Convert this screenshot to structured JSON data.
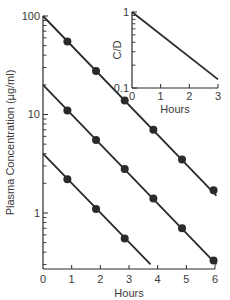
{
  "chart_data": [
    {
      "type": "line",
      "title": "",
      "xlabel": "Hours",
      "ylabel": "Plasma Concentration (µg/ml)",
      "yscale": "log",
      "xlim": [
        0,
        6
      ],
      "ylim": [
        0.27,
        100
      ],
      "x_ticks": [
        0,
        1,
        2,
        3,
        4,
        5,
        6
      ],
      "x_tick_labels": [
        "0",
        "1",
        "2",
        "3",
        "4",
        "5",
        "6"
      ],
      "y_tick_labels": [
        {
          "value": 100,
          "label": "100"
        },
        {
          "value": 10,
          "label": "10"
        },
        {
          "value": 1,
          "label": "1"
        }
      ],
      "grid": false,
      "series": [
        {
          "name": "dose-high",
          "line": {
            "x": [
              0,
              6.05
            ],
            "y": [
              100,
              1.5
            ]
          },
          "points": {
            "x": [
              0.85,
              1.85,
              2.85,
              3.85,
              4.85,
              5.95
            ],
            "y": [
              55,
              27.7,
              13.9,
              7.0,
              3.5,
              1.7
            ]
          }
        },
        {
          "name": "dose-mid",
          "line": {
            "x": [
              0,
              6.05
            ],
            "y": [
              20,
              0.3
            ]
          },
          "points": {
            "x": [
              0.85,
              1.85,
              2.85,
              3.85,
              4.85,
              5.95
            ],
            "y": [
              11,
              5.5,
              2.8,
              1.4,
              0.7,
              0.33
            ]
          }
        },
        {
          "name": "dose-low",
          "line": {
            "x": [
              0,
              3.75
            ],
            "y": [
              4,
              0.3
            ]
          },
          "points": {
            "x": [
              0.85,
              1.85,
              2.85
            ],
            "y": [
              2.2,
              1.1,
              0.55
            ]
          }
        }
      ]
    },
    {
      "type": "line",
      "title": "",
      "xlabel": "Hours",
      "ylabel": "C/D",
      "yscale": "log",
      "xlim": [
        0,
        3
      ],
      "ylim": [
        0.1,
        1
      ],
      "x_ticks": [
        0,
        1,
        2,
        3
      ],
      "x_tick_labels": [
        "0",
        "1",
        "2",
        "3"
      ],
      "y_tick_labels": [
        {
          "value": 1,
          "label": "1"
        },
        {
          "value": 0.1,
          "label": "0.1"
        }
      ],
      "grid": false,
      "series": [
        {
          "name": "normalized",
          "line": {
            "x": [
              0,
              3
            ],
            "y": [
              1,
              0.13
            ]
          }
        }
      ]
    }
  ]
}
